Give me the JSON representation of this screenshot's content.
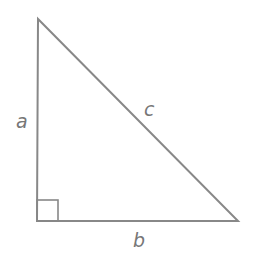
{
  "diagram": {
    "labels": {
      "a": "a",
      "b": "b",
      "c": "c"
    },
    "colors": {
      "stroke": "#888888",
      "label": "#777777",
      "background": "#ffffff"
    },
    "vertices": {
      "top": [
        38,
        19
      ],
      "bottom_left": [
        37,
        221
      ],
      "bottom_right": [
        238,
        221
      ]
    },
    "right_angle_marker": {
      "x": 37,
      "y": 200,
      "size": 21
    }
  }
}
